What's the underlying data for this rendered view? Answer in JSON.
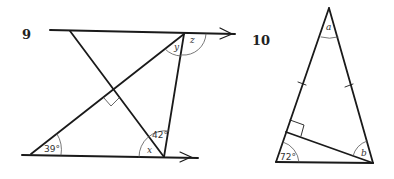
{
  "figures": [
    {
      "number": "9",
      "labels": {
        "top_apex_inner": "y",
        "top_apex_outer": "z",
        "bottom_left_angle": "39°",
        "bottom_right_upper_angle": "42°",
        "bottom_right_lower_angle": "x"
      },
      "features": [
        "two parallel lines with arrows",
        "right angle mark at line intersection"
      ]
    },
    {
      "number": "10",
      "labels": {
        "apex_angle": "a",
        "bottom_left_angle": "72°",
        "bottom_right_angle": "b"
      },
      "features": [
        "isosceles triangle with equal-side tick marks",
        "perpendicular from bottom-right vertex to left side with right angle mark"
      ]
    }
  ],
  "colors": {
    "line": "#1a1a1a",
    "background": "#ffffff"
  }
}
